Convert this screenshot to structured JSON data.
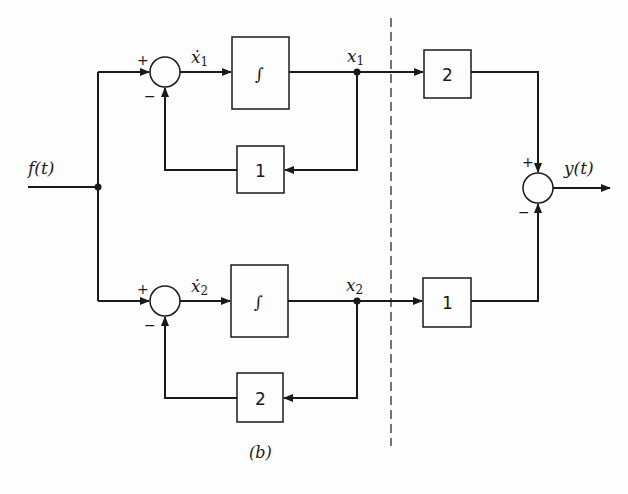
{
  "diagram": {
    "caption": "(b)",
    "input": {
      "label": "f(t)"
    },
    "output": {
      "label": "y(t)"
    },
    "top_branch": {
      "summer": {
        "plus": "+",
        "minus": "−"
      },
      "state_derivative": "ẋ",
      "state_derivative_sub": "1",
      "integrator": "∫",
      "state": "x",
      "state_sub": "1",
      "feedback_gain": "1",
      "output_gain": "2"
    },
    "bottom_branch": {
      "summer": {
        "plus": "+",
        "minus": "−"
      },
      "state_derivative": "ẋ",
      "state_derivative_sub": "2",
      "integrator": "∫",
      "state": "x",
      "state_sub": "2",
      "feedback_gain": "2",
      "output_gain": "1"
    },
    "output_summer": {
      "plus": "+",
      "minus": "−"
    },
    "colors": {
      "line": "#1a1a1a",
      "background": "#fdfdfd"
    }
  }
}
